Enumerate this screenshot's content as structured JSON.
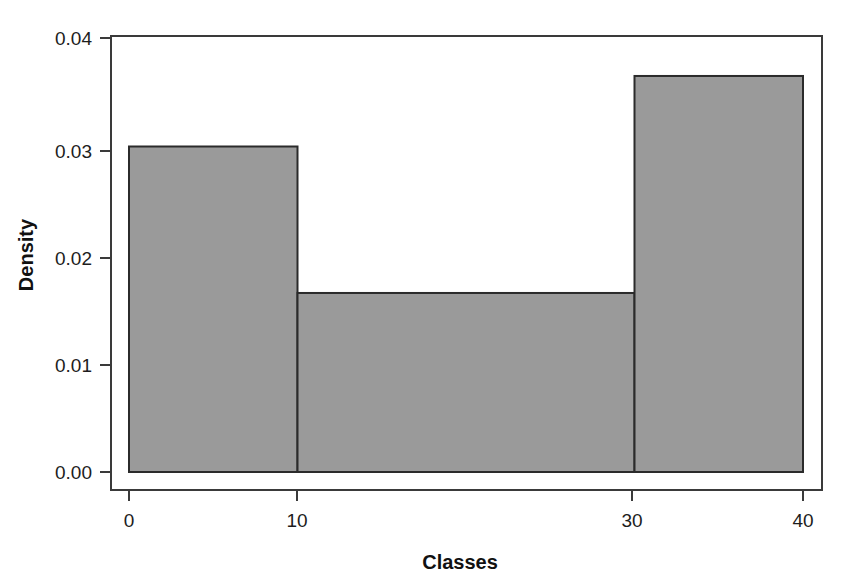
{
  "chart_data": {
    "type": "bar",
    "subtype": "histogram",
    "title": "",
    "subtitle": "",
    "xlabel": "Classes",
    "ylabel": "Density",
    "xlim": [
      0,
      40
    ],
    "ylim": [
      0.0,
      0.04
    ],
    "grid": false,
    "legend": null,
    "legend_position": "none",
    "bin_edges": [
      0,
      10,
      30,
      40
    ],
    "categories": [
      "0-10",
      "10-30",
      "30-40"
    ],
    "values": [
      0.03,
      0.0165,
      0.0365
    ],
    "bars": [
      {
        "label": "0-10",
        "x_start": 0,
        "x_end": 10,
        "density": 0.03
      },
      {
        "label": "10-30",
        "x_start": 10,
        "x_end": 30,
        "density": 0.0165
      },
      {
        "label": "30-40",
        "x_start": 30,
        "x_end": 40,
        "density": 0.0365
      }
    ],
    "x_ticks": [
      {
        "value": 0,
        "label": "0"
      },
      {
        "value": 10,
        "label": "10"
      },
      {
        "value": 30,
        "label": "30"
      },
      {
        "value": 40,
        "label": "40"
      }
    ],
    "y_ticks": [
      {
        "value": 0.0,
        "label": "0.00"
      },
      {
        "value": 0.01,
        "label": "0.01"
      },
      {
        "value": 0.02,
        "label": "0.02"
      },
      {
        "value": 0.03,
        "label": "0.03"
      },
      {
        "value": 0.04,
        "label": "0.04"
      }
    ],
    "colors": {
      "bar_fill": "#9a9a9a",
      "bar_stroke": "#2b2b2b",
      "axis": "#3a3a3a",
      "text": "#1d1d1d",
      "background": "#ffffff"
    }
  },
  "axes": {
    "x_title": "Classes",
    "y_title": "Density",
    "x_tick_labels": [
      "0",
      "10",
      "30",
      "40"
    ],
    "y_tick_labels": [
      "0.00",
      "0.01",
      "0.02",
      "0.03",
      "0.04"
    ]
  }
}
